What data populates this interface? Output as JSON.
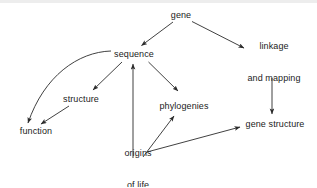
{
  "diagram": {
    "background_color": "#ffffff",
    "line_color": "#2b2b2b",
    "text_color": "#1b1b1b",
    "width": 317,
    "height": 187,
    "nodes": [
      {
        "id": "gene",
        "label": "gene",
        "line1": "gene",
        "line2": "",
        "x": 181,
        "y": 15
      },
      {
        "id": "sequence",
        "label": "sequence",
        "line1": "sequence",
        "line2": "",
        "x": 134,
        "y": 54
      },
      {
        "id": "linkage",
        "label": "linkage and mapping",
        "line1": "linkage",
        "line2": "and mapping",
        "x": 274,
        "y": 62
      },
      {
        "id": "structure",
        "label": "structure",
        "line1": "structure",
        "line2": "",
        "x": 81,
        "y": 99
      },
      {
        "id": "phylogenies",
        "label": "phylogenies",
        "line1": "phylogenies",
        "line2": "",
        "x": 184,
        "y": 106
      },
      {
        "id": "function",
        "label": "function",
        "line1": "function",
        "line2": "",
        "x": 36,
        "y": 131
      },
      {
        "id": "gene-structure",
        "label": "gene structure",
        "line1": "gene structure",
        "line2": "",
        "x": 275,
        "y": 124
      },
      {
        "id": "origins",
        "label": "origins of life",
        "line1": "origins",
        "line2": "of life",
        "x": 138,
        "y": 169
      }
    ],
    "edges": [
      {
        "id": "gene-to-sequence",
        "from": "gene",
        "to": "sequence",
        "style": "straight"
      },
      {
        "id": "gene-to-linkage",
        "from": "gene",
        "to": "linkage",
        "style": "straight"
      },
      {
        "id": "sequence-to-structure",
        "from": "sequence",
        "to": "structure",
        "style": "straight"
      },
      {
        "id": "sequence-to-phylogenies",
        "from": "sequence",
        "to": "phylogenies",
        "style": "straight"
      },
      {
        "id": "sequence-to-function",
        "from": "sequence",
        "to": "function",
        "style": "curved"
      },
      {
        "id": "structure-to-function",
        "from": "structure",
        "to": "function",
        "style": "straight"
      },
      {
        "id": "linkage-to-gene-structure",
        "from": "linkage",
        "to": "gene-structure",
        "style": "straight"
      },
      {
        "id": "origins-to-sequence",
        "from": "origins",
        "to": "sequence",
        "style": "straight"
      },
      {
        "id": "origins-to-phylogenies",
        "from": "origins",
        "to": "phylogenies",
        "style": "straight"
      },
      {
        "id": "origins-to-gene-structure",
        "from": "origins",
        "to": "gene-structure",
        "style": "straight"
      }
    ]
  }
}
